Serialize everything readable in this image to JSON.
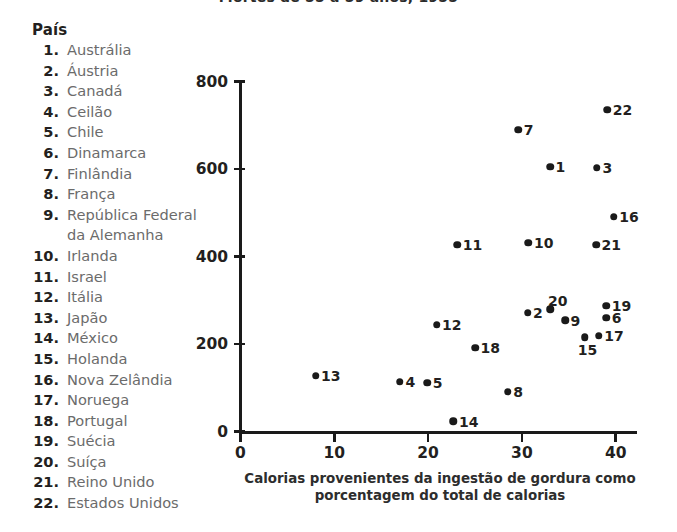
{
  "chart_title": "Mortes de 55 a 59 anos, 1955",
  "legend": {
    "heading": "País",
    "items": [
      {
        "num": "1.",
        "name": "Austrália"
      },
      {
        "num": "2.",
        "name": "Áustria"
      },
      {
        "num": "3.",
        "name": "Canadá"
      },
      {
        "num": "4.",
        "name": "Ceilão"
      },
      {
        "num": "5.",
        "name": "Chile"
      },
      {
        "num": "6.",
        "name": "Dinamarca"
      },
      {
        "num": "7.",
        "name": "Finlândia"
      },
      {
        "num": "8.",
        "name": "França"
      },
      {
        "num": "9.",
        "name": "República Federal",
        "name2": "da Alemanha"
      },
      {
        "num": "10.",
        "name": "Irlanda"
      },
      {
        "num": "11.",
        "name": "Israel"
      },
      {
        "num": "12.",
        "name": "Itália"
      },
      {
        "num": "13.",
        "name": "Japão"
      },
      {
        "num": "14.",
        "name": "México"
      },
      {
        "num": "15.",
        "name": "Holanda"
      },
      {
        "num": "16.",
        "name": "Nova Zelândia"
      },
      {
        "num": "17.",
        "name": "Noruega"
      },
      {
        "num": "18.",
        "name": "Portugal"
      },
      {
        "num": "19.",
        "name": "Suécia"
      },
      {
        "num": "20.",
        "name": "Suíça"
      },
      {
        "num": "21.",
        "name": "Reino Unido"
      },
      {
        "num": "22.",
        "name": "Estados Unidos"
      }
    ]
  },
  "chart_data": {
    "type": "scatter",
    "title": "Mortes de 55 a 59 anos, 1955",
    "xlabel": "Calorias provenientes da ingestão de gordura como porcentagem do total de calorias",
    "xlabel_line1": "Calorias provenientes da ingestão de gordura como",
    "xlabel_line2": "porcentagem do total de calorias",
    "ylabel": "",
    "xlim": [
      0,
      42.3
    ],
    "ylim": [
      0,
      800
    ],
    "xticks": [
      0,
      10,
      20,
      30,
      40
    ],
    "yticks": [
      0,
      200,
      400,
      600,
      800
    ],
    "xtick_labels": [
      "0",
      "10",
      "20",
      "30",
      "40"
    ],
    "ytick_labels": [
      "0",
      "200",
      "400",
      "600",
      "800"
    ],
    "grid": false,
    "legend_position": "left-outside",
    "point_color": "#1a1a1a",
    "axis_color": "#1a1a1a",
    "points": [
      {
        "label": "1",
        "country": "Austrália",
        "x": 33.0,
        "y": 605,
        "lp": "right"
      },
      {
        "label": "2",
        "country": "Áustria",
        "x": 30.6,
        "y": 272,
        "lp": "right"
      },
      {
        "label": "3",
        "country": "Canadá",
        "x": 38.0,
        "y": 603,
        "lp": "right"
      },
      {
        "label": "4",
        "country": "Ceilão",
        "x": 17.0,
        "y": 114,
        "lp": "right"
      },
      {
        "label": "5",
        "country": "Chile",
        "x": 19.9,
        "y": 112,
        "lp": "right"
      },
      {
        "label": "6",
        "country": "Dinamarca",
        "x": 39.0,
        "y": 260,
        "lp": "right"
      },
      {
        "label": "7",
        "country": "Finlândia",
        "x": 29.6,
        "y": 690,
        "lp": "right"
      },
      {
        "label": "8",
        "country": "França",
        "x": 28.5,
        "y": 91,
        "lp": "right"
      },
      {
        "label": "9",
        "country": "República Federal da Alemanha",
        "x": 34.6,
        "y": 254,
        "lp": "right"
      },
      {
        "label": "10",
        "country": "Irlanda",
        "x": 30.7,
        "y": 432,
        "lp": "right"
      },
      {
        "label": "11",
        "country": "Israel",
        "x": 23.1,
        "y": 427,
        "lp": "right"
      },
      {
        "label": "12",
        "country": "Itália",
        "x": 20.9,
        "y": 244,
        "lp": "right"
      },
      {
        "label": "13",
        "country": "Japão",
        "x": 8.0,
        "y": 128,
        "lp": "right"
      },
      {
        "label": "14",
        "country": "México",
        "x": 22.7,
        "y": 23,
        "lp": "right"
      },
      {
        "label": "15",
        "country": "Holanda",
        "x": 36.7,
        "y": 215,
        "lp": "below"
      },
      {
        "label": "16",
        "country": "Nova Zelândia",
        "x": 39.8,
        "y": 491,
        "lp": "right"
      },
      {
        "label": "17",
        "country": "Noruega",
        "x": 38.2,
        "y": 219,
        "lp": "right"
      },
      {
        "label": "18",
        "country": "Portugal",
        "x": 25.0,
        "y": 192,
        "lp": "right"
      },
      {
        "label": "19",
        "country": "Suécia",
        "x": 39.0,
        "y": 288,
        "lp": "right"
      },
      {
        "label": "20",
        "country": "Suíça",
        "x": 33.0,
        "y": 279,
        "lp": "above"
      },
      {
        "label": "21",
        "country": "Reino Unido",
        "x": 37.9,
        "y": 427,
        "lp": "right"
      },
      {
        "label": "22",
        "country": "Estados Unidos",
        "x": 39.1,
        "y": 735,
        "lp": "right"
      }
    ]
  }
}
